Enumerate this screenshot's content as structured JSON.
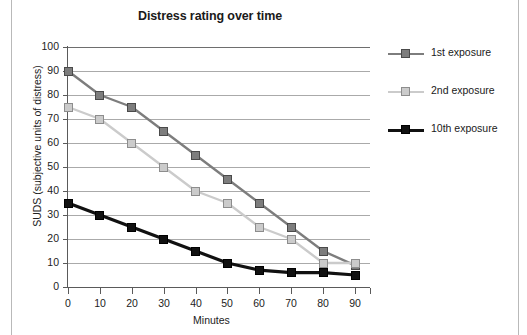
{
  "figure": {
    "width": 527,
    "height": 335,
    "background": "#ffffff",
    "page_rule_color": "#b9b9b9"
  },
  "chart_data": {
    "type": "line",
    "title": "Distress rating over time",
    "xlabel": "Minutes",
    "ylabel": "SUDS (subjective units of distress)",
    "x": [
      0,
      10,
      20,
      30,
      40,
      50,
      60,
      70,
      80,
      90
    ],
    "xlim": [
      0,
      90
    ],
    "ylim": [
      0,
      100
    ],
    "xticks": [
      "0",
      "10",
      "20",
      "30",
      "40",
      "50",
      "60",
      "70",
      "80",
      "90"
    ],
    "yticks": [
      "0",
      "10",
      "20",
      "30",
      "40",
      "50",
      "60",
      "70",
      "80",
      "90",
      "100"
    ],
    "grid": "horizontal",
    "legend_position": "right",
    "series": [
      {
        "name": "1st exposure",
        "color": "#7d7d7d",
        "marker_fill": "#7d7d7d",
        "marker_edge": "#4a4a4a",
        "line_width": 2.4,
        "values": [
          90,
          80,
          75,
          65,
          55,
          45,
          35,
          25,
          15,
          9
        ]
      },
      {
        "name": "2nd exposure",
        "color": "#cbcbcb",
        "marker_fill": "#cbcbcb",
        "marker_edge": "#8d8d8d",
        "line_width": 2.4,
        "values": [
          75,
          70,
          60,
          50,
          40,
          35,
          25,
          20,
          10,
          10
        ]
      },
      {
        "name": "10th exposure",
        "color": "#111111",
        "marker_fill": "#111111",
        "marker_edge": "#000000",
        "line_width": 3.2,
        "values": [
          35,
          30,
          25,
          20,
          15,
          10,
          7,
          6,
          6,
          5
        ]
      }
    ]
  },
  "axis": {
    "line_color": "#5a5a5a",
    "grid_color": "#aaaaaa",
    "top_rule_color": "#6e6e6e"
  }
}
